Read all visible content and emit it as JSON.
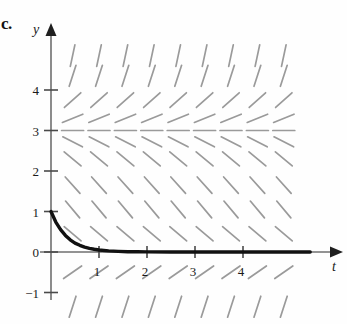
{
  "figure": {
    "part_label": "c.",
    "axes": {
      "x_axis_name": "t",
      "y_axis_name": "y",
      "x_ticks": [
        "1",
        "2",
        "3",
        "4"
      ],
      "x_tick_values": [
        1,
        2,
        3,
        4
      ],
      "y_ticks": [
        "4",
        "3",
        "2",
        "1",
        "0",
        "−1"
      ],
      "y_tick_values": [
        4,
        3,
        2,
        1,
        0,
        -1
      ],
      "x_range": [
        -0.25,
        5.7
      ],
      "y_range": [
        -1.7,
        5.1
      ]
    },
    "colors": {
      "axis": "#6f6f6f",
      "slope_mark": "#9a9a9a",
      "solution_curve": "#111111",
      "text": "#1a1a1a",
      "background": "#fefefe"
    }
  },
  "chart_data": {
    "type": "line",
    "title": "",
    "subtitle": "",
    "xlabel": "t",
    "ylabel": "y",
    "xlim": [
      -0.25,
      5.7
    ],
    "ylim": [
      -1.7,
      5.1
    ],
    "xticks": [
      1,
      2,
      3,
      4
    ],
    "yticks": [
      -1,
      0,
      1,
      2,
      3,
      4
    ],
    "grid": false,
    "legend": null,
    "annotations": [
      "c."
    ],
    "slope_field": {
      "style": "short line segments, gray",
      "x_samples": [
        0.45,
        1.0,
        1.55,
        2.1,
        2.65,
        3.2,
        3.75,
        4.3,
        4.85
      ],
      "y_samples": [
        -1.35,
        -0.5,
        0.45,
        1.05,
        1.65,
        2.3,
        2.72,
        3.0,
        3.3,
        3.75,
        4.35,
        4.85
      ],
      "slopes_by_y": [
        {
          "y": 4.85,
          "slope_angle_deg": 78
        },
        {
          "y": 4.35,
          "slope_angle_deg": 72
        },
        {
          "y": 3.75,
          "slope_angle_deg": 42
        },
        {
          "y": 3.3,
          "slope_angle_deg": 22
        },
        {
          "y": 3.0,
          "slope_angle_deg": 0
        },
        {
          "y": 2.72,
          "slope_angle_deg": -27
        },
        {
          "y": 2.3,
          "slope_angle_deg": -40
        },
        {
          "y": 1.65,
          "slope_angle_deg": -48
        },
        {
          "y": 1.05,
          "slope_angle_deg": -50
        },
        {
          "y": 0.45,
          "slope_angle_deg": -40
        },
        {
          "y": -0.5,
          "slope_angle_deg": 35
        },
        {
          "y": -1.35,
          "slope_angle_deg": 72
        }
      ],
      "equilibrium_line_y": 3
    },
    "series": [
      {
        "name": "solution curve",
        "type": "line",
        "initial_condition": {
          "t": 0,
          "y": 1
        },
        "asymptote_y": 0,
        "x": [
          0,
          0.1,
          0.2,
          0.3,
          0.4,
          0.5,
          0.6,
          0.7,
          0.8,
          0.9,
          1.0,
          1.2,
          1.4,
          1.6,
          1.8,
          2.0,
          2.5,
          3.0,
          3.5,
          4.0,
          4.5,
          5.0,
          5.4
        ],
        "y": [
          1.0,
          0.74,
          0.55,
          0.41,
          0.3,
          0.22,
          0.165,
          0.122,
          0.09,
          0.067,
          0.05,
          0.027,
          0.015,
          0.008,
          0.0045,
          0.0025,
          0.0006,
          0.0002,
          0.0001,
          0.0,
          0.0,
          0.0,
          0.0
        ]
      }
    ]
  }
}
